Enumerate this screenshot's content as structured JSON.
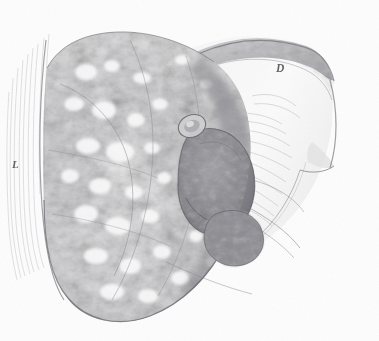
{
  "figure": {
    "caption": "Fig. 364.",
    "background_color": "#fdfdfd",
    "ink_color": "#4a4a4a",
    "width": 379,
    "height": 341
  },
  "labels": [
    {
      "id": "L",
      "text": "L",
      "x": 12,
      "y": 158,
      "description": "left-margin reference letter"
    },
    {
      "id": "D",
      "text": "D",
      "x": 276,
      "y": 62,
      "description": "upper-right reference letter"
    }
  ],
  "illustration": {
    "type": "anatomical-engraving",
    "medium": "stipple and line engraving, monochrome grey wash",
    "subject": "opened hollow organ specimen with mottled nodular wall and dark interior cavities",
    "regions": [
      {
        "name": "nodular-granular-wall",
        "description": "large mottled pale mass with dense white stipple nodules occupying the left two thirds"
      },
      {
        "name": "hatched-left-margin",
        "description": "fine vertical hatching lines along the left cut edge"
      },
      {
        "name": "reflected-flap",
        "description": "pale smooth membrane folded back toward the upper right, ending in a pointed tip"
      },
      {
        "name": "dark-cavity",
        "description": "deep shaded recess in the right centre of the specimen"
      },
      {
        "name": "small-orifice",
        "description": "small oval opening above the dark cavity"
      },
      {
        "name": "lower-cavity",
        "description": "second smaller shaded recess toward the lower right"
      },
      {
        "name": "fibrous-striations",
        "description": "sweeping curved fibre lines radiating from the cavities to the right margin"
      }
    ],
    "palette": {
      "paper": "#fdfdfd",
      "light_tissue": "#e9e9ea",
      "mid_tissue": "#c9c9cc",
      "dark_tissue": "#9a9a9e",
      "deep_shadow": "#6f6f74",
      "outline": "#4a4a4a"
    }
  }
}
